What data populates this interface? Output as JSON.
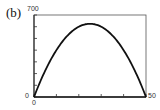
{
  "panel_label": "(b)",
  "chart_data": {
    "type": "line",
    "title": "",
    "xlabel": "",
    "ylabel": "",
    "xlim": [
      0,
      50
    ],
    "ylim": [
      0,
      700
    ],
    "x_ticks": [
      0,
      10,
      20,
      30,
      40,
      50
    ],
    "x_tick_labels": [
      "0",
      "50"
    ],
    "y_ticks": [
      0,
      100,
      200,
      300,
      400,
      500,
      600,
      700
    ],
    "y_tick_labels": [
      "0",
      "700"
    ],
    "grid": false,
    "series": [
      {
        "name": "curve",
        "x": [
          0,
          5,
          10,
          15,
          20,
          25,
          30,
          35,
          40,
          45,
          50
        ],
        "y": [
          0,
          225,
          400,
          525,
          600,
          625,
          600,
          525,
          400,
          225,
          0
        ]
      }
    ]
  },
  "labels": {
    "y_max": "700",
    "y_min": "0",
    "x_min": "0",
    "x_max": "50"
  }
}
